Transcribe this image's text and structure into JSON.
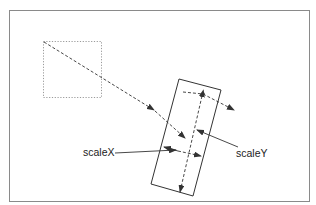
{
  "diagram": {
    "labels": {
      "scaleX": "scaleX",
      "scaleY": "scaleY"
    },
    "colors": {
      "frame": "#8a8a8a",
      "stroke": "#333333",
      "dotted": "#9a9a9a",
      "background": "#ffffff"
    },
    "elements": {
      "frame": {
        "x": 9,
        "y": 10,
        "width": 301,
        "height": 192
      },
      "source_square": {
        "x": 43,
        "y": 41,
        "width": 59,
        "height": 57,
        "style": "dotted"
      },
      "transformed_rectangle": {
        "corners": [
          [
            179,
            79
          ],
          [
            221,
            90
          ],
          [
            193,
            196
          ],
          [
            151,
            184
          ]
        ],
        "style": "solid"
      },
      "translation_path": {
        "from": [
          44,
          42
        ],
        "to": [
          185,
          138
        ],
        "style": "dashed"
      }
    }
  }
}
